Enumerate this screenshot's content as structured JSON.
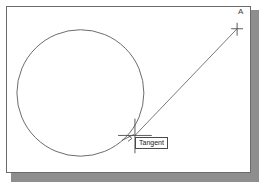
{
  "scene": {
    "title": "Tangent object snap in CAD drawing",
    "background_color": "#ffffff",
    "frame_border_color": "#6b6b6b",
    "shadow_color": "#8e8e8e",
    "geometry_stroke_color": "#5a5a5a",
    "marker_stroke_color": "#4a4a4a"
  },
  "labels": {
    "point_a": "A",
    "osnap_tooltip": "Tangent"
  },
  "geometry": {
    "circle": {
      "name": "circle",
      "cx": 80,
      "cy": 93,
      "r": 64
    },
    "tangent_line": {
      "name": "tangent-line",
      "x1": 130,
      "y1": 130,
      "x2": 233,
      "y2": 23
    },
    "cursor_crosshair": {
      "name": "cursor-crosshair",
      "cx": 130,
      "cy": 130,
      "arm": 17
    },
    "point_a_marker": {
      "name": "point-a-marker",
      "cx": 233,
      "cy": 23,
      "arm": 5
    },
    "tangent_snap_marker": {
      "name": "tangent-snap-marker",
      "cx": 127,
      "cy": 133
    }
  }
}
